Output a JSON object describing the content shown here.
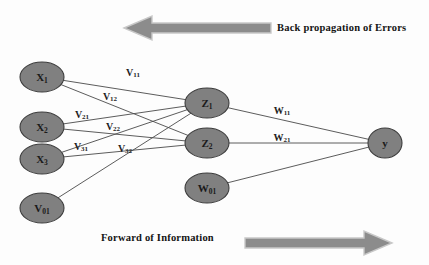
{
  "diagram": {
    "background_color": "#fdfdfd",
    "node_fill_color": "#808080",
    "node_stroke_color": "#3c3c3c",
    "edge_color": "#4a4a4a",
    "arrow_fill_color": "#8c8c8c",
    "arrow_stroke_color": "#b0b0b0",
    "text_color": "#141414"
  },
  "captions": {
    "back_propagation": "Back propagation of Errors",
    "forward": "Forward of Information"
  },
  "arrows": {
    "back": {
      "direction": "left",
      "name": "back-propagation-arrow"
    },
    "forward": {
      "direction": "right",
      "name": "forward-information-arrow"
    }
  },
  "nodes": {
    "input_layer": [
      {
        "id": "x1",
        "base": "X",
        "sub": "1",
        "cx": 42,
        "cy": 77,
        "rx": 22,
        "ry": 15
      },
      {
        "id": "x2",
        "base": "X",
        "sub": "2",
        "cx": 42,
        "cy": 127,
        "rx": 22,
        "ry": 15
      },
      {
        "id": "x3",
        "base": "X",
        "sub": "3",
        "cx": 42,
        "cy": 159,
        "rx": 22,
        "ry": 15
      },
      {
        "id": "v01",
        "base": "V",
        "sub": "01",
        "cx": 42,
        "cy": 208,
        "rx": 22,
        "ry": 15
      }
    ],
    "hidden_layer": [
      {
        "id": "z1",
        "base": "Z",
        "sub": "1",
        "cx": 207,
        "cy": 103,
        "rx": 22,
        "ry": 15
      },
      {
        "id": "z2",
        "base": "Z",
        "sub": "2",
        "cx": 207,
        "cy": 143,
        "rx": 22,
        "ry": 15
      },
      {
        "id": "w01",
        "base": "W",
        "sub": "01",
        "cx": 207,
        "cy": 188,
        "rx": 22,
        "ry": 15
      }
    ],
    "output_layer": [
      {
        "id": "y",
        "base": "y",
        "sub": "",
        "cx": 385,
        "cy": 143,
        "rx": 17,
        "ry": 15
      }
    ]
  },
  "edges": [
    {
      "id": "x1-z1",
      "from": "x1",
      "to": "z1"
    },
    {
      "id": "x1-z2",
      "from": "x1",
      "to": "z2"
    },
    {
      "id": "x2-z1",
      "from": "x2",
      "to": "z1"
    },
    {
      "id": "x2-z2",
      "from": "x2",
      "to": "z2"
    },
    {
      "id": "x3-z1",
      "from": "x3",
      "to": "z1"
    },
    {
      "id": "x3-z2",
      "from": "x3",
      "to": "z2"
    },
    {
      "id": "v01-z1",
      "from": "v01",
      "to": "z1"
    },
    {
      "id": "z1-y",
      "from": "z1",
      "to": "y"
    },
    {
      "id": "z2-y",
      "from": "z2",
      "to": "y"
    },
    {
      "id": "w01-y",
      "from": "w01",
      "to": "y"
    }
  ],
  "weight_labels": [
    {
      "id": "v11",
      "base": "V",
      "sub": "11",
      "x": 133,
      "y": 72
    },
    {
      "id": "v12",
      "base": "V",
      "sub": "12",
      "x": 110,
      "y": 96
    },
    {
      "id": "v21",
      "base": "V",
      "sub": "21",
      "x": 82,
      "y": 114
    },
    {
      "id": "v22",
      "base": "V",
      "sub": "22",
      "x": 113,
      "y": 126
    },
    {
      "id": "v31",
      "base": "V",
      "sub": "31",
      "x": 81,
      "y": 146
    },
    {
      "id": "v32",
      "base": "V",
      "sub": "32",
      "x": 125,
      "y": 148
    },
    {
      "id": "w11",
      "base": "W",
      "sub": "11",
      "x": 282,
      "y": 110
    },
    {
      "id": "w21",
      "base": "W",
      "sub": "21",
      "x": 282,
      "y": 137
    }
  ]
}
